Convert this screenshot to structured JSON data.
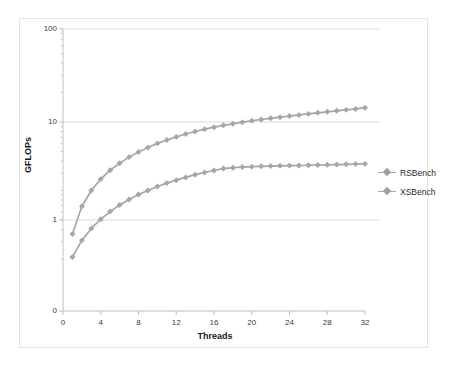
{
  "chart_data": {
    "type": "line",
    "title": "",
    "xlabel": "Threads",
    "ylabel": "GFLOPs",
    "xlim": [
      0,
      32
    ],
    "ylim": [
      0.2,
      100
    ],
    "yscale": "log",
    "xscale": "linear",
    "grid": "horizontal-major",
    "legend_position": "right",
    "x_ticks": [
      "0",
      "4",
      "8",
      "12",
      "16",
      "20",
      "24",
      "28",
      "32"
    ],
    "y_ticks": [
      "100",
      "10",
      "1",
      "0"
    ],
    "x": [
      1,
      2,
      3,
      4,
      5,
      6,
      7,
      8,
      9,
      10,
      11,
      12,
      13,
      14,
      15,
      16,
      17,
      18,
      19,
      20,
      21,
      22,
      23,
      24,
      25,
      26,
      27,
      28,
      29,
      30,
      31,
      32
    ],
    "series": [
      {
        "name": "RSBench",
        "color": "#a6a6a6",
        "marker": "diamond",
        "values": [
          0.72,
          1.38,
          2.0,
          2.62,
          3.22,
          3.8,
          4.38,
          4.95,
          5.5,
          6.05,
          6.55,
          7.05,
          7.55,
          8.0,
          8.45,
          8.85,
          9.25,
          9.6,
          9.95,
          10.3,
          10.6,
          10.9,
          11.2,
          11.5,
          11.8,
          12.1,
          12.4,
          12.7,
          13.0,
          13.3,
          13.6,
          14.0
        ]
      },
      {
        "name": "XSBench",
        "color": "#a6a6a6",
        "marker": "diamond",
        "values": [
          0.42,
          0.62,
          0.82,
          1.02,
          1.22,
          1.42,
          1.62,
          1.82,
          2.0,
          2.2,
          2.38,
          2.55,
          2.72,
          2.9,
          3.05,
          3.2,
          3.35,
          3.42,
          3.47,
          3.5,
          3.53,
          3.55,
          3.57,
          3.59,
          3.6,
          3.62,
          3.64,
          3.66,
          3.68,
          3.7,
          3.72,
          3.74
        ]
      }
    ]
  },
  "axes": {
    "y_title": "GFLOPs",
    "x_title": "Threads",
    "y_tick_labels": [
      "100",
      "10",
      "1",
      "0"
    ],
    "x_tick_labels": [
      "0",
      "4",
      "8",
      "12",
      "16",
      "20",
      "24",
      "28",
      "32"
    ]
  },
  "legend": {
    "items": [
      {
        "label": "RSBench"
      },
      {
        "label": "XSBench"
      }
    ]
  },
  "colors": {
    "series": "#a6a6a6",
    "gridline": "#d9d9d9",
    "axis": "#bfbfbf",
    "frame": "#e3e3e3",
    "text": "#3a3a3a"
  }
}
